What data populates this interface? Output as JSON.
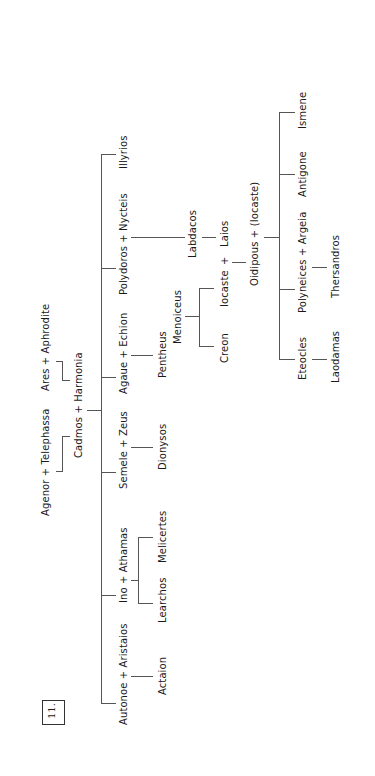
{
  "figure_number": "11.",
  "tree": {
    "gen0": {
      "left_couple": "Agenor + Telephassa",
      "right_couple": "Ares + Aphrodite"
    },
    "gen1": {
      "couple": "Cadmos + Harmonia"
    },
    "gen2": [
      {
        "label": "Autonoe + Aristaios"
      },
      {
        "label": "Ino + Athamas"
      },
      {
        "label": "Semele + Zeus"
      },
      {
        "label": "Agaue + Echion"
      },
      {
        "label": "Polydoros + Nycteis"
      },
      {
        "label": "Illyrios"
      }
    ],
    "gen3": [
      {
        "label": "Actaion",
        "parent": "Autonoe + Aristaios"
      },
      {
        "label": "Learchos",
        "parent": "Ino + Athamas"
      },
      {
        "label": "Melicertes",
        "parent": "Ino + Athamas"
      },
      {
        "label": "Dionysos",
        "parent": "Semele + Zeus"
      },
      {
        "label": "Pentheus",
        "parent": "Agaue + Echion"
      },
      {
        "label": "Labdacos",
        "parent": "Polydoros + Nycteis"
      }
    ],
    "menoiceus": "Menoiceus",
    "menoiceus_children": [
      "Creon",
      "Iocaste"
    ],
    "laios": "Laios",
    "plus": "+",
    "oidipous_couple": "Oidipous + (Iocaste)",
    "gen_children": [
      {
        "label": "Eteocles",
        "child": "Laodamas"
      },
      {
        "label": "Polyneices + Argeia",
        "child": "Thersandros"
      },
      {
        "label": "Antigone"
      },
      {
        "label": "Ismene"
      }
    ]
  }
}
